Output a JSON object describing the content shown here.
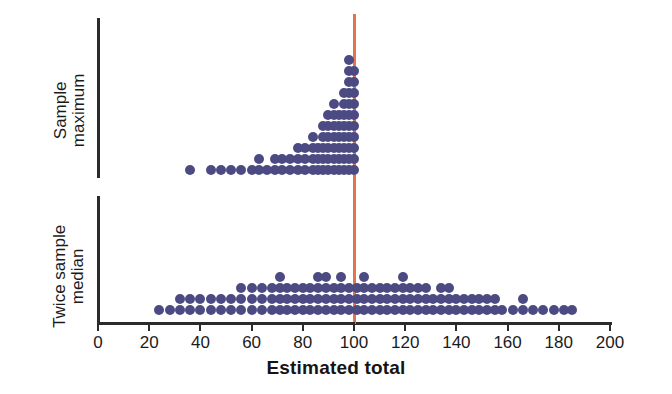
{
  "chart_data": {
    "type": "scatter",
    "plot_style": "dotplot",
    "title": "",
    "xlabel": "Estimated total",
    "ylabel": "",
    "xlim": [
      0,
      200
    ],
    "grid": false,
    "legend": "none",
    "xticks": [
      0,
      20,
      40,
      60,
      80,
      100,
      120,
      140,
      160,
      180,
      200
    ],
    "xtick_labels": [
      "0",
      "20",
      "40",
      "60",
      "80",
      "100",
      "120",
      "140",
      "160",
      "180",
      "200"
    ],
    "annotations": [
      {
        "name": "true-total-reference-line",
        "type": "vline",
        "x": 100,
        "color": "#e8724a"
      }
    ],
    "dot_color": "#4c4a82",
    "axis_color": "#2b2b2b",
    "panels": [
      {
        "name": "sample-maximum",
        "label_line1": "Sample",
        "label_line2": "maximum",
        "direction": "up",
        "baseline_y": 170,
        "dot_spacing": 11.0,
        "stacks": [
          {
            "x": 36,
            "count": 1
          },
          {
            "x": 44,
            "count": 1
          },
          {
            "x": 48,
            "count": 1
          },
          {
            "x": 52,
            "count": 1
          },
          {
            "x": 56,
            "count": 1
          },
          {
            "x": 60,
            "count": 1
          },
          {
            "x": 63,
            "count": 2
          },
          {
            "x": 66,
            "count": 1
          },
          {
            "x": 69,
            "count": 2
          },
          {
            "x": 72,
            "count": 2
          },
          {
            "x": 75,
            "count": 2
          },
          {
            "x": 78,
            "count": 3
          },
          {
            "x": 81,
            "count": 3
          },
          {
            "x": 84,
            "count": 4
          },
          {
            "x": 86,
            "count": 3
          },
          {
            "x": 88,
            "count": 5
          },
          {
            "x": 90,
            "count": 6
          },
          {
            "x": 92,
            "count": 7
          },
          {
            "x": 94,
            "count": 6
          },
          {
            "x": 96,
            "count": 8
          },
          {
            "x": 98,
            "count": 11
          },
          {
            "x": 100,
            "count": 10
          }
        ]
      },
      {
        "name": "twice-sample-median",
        "label_line1": "Twice sample",
        "label_line2": "median",
        "direction": "up",
        "baseline_y": 310,
        "dot_spacing": 11.0,
        "stacks": [
          {
            "x": 24,
            "count": 1
          },
          {
            "x": 28,
            "count": 1
          },
          {
            "x": 32,
            "count": 2
          },
          {
            "x": 36,
            "count": 2
          },
          {
            "x": 40,
            "count": 2
          },
          {
            "x": 44,
            "count": 2
          },
          {
            "x": 48,
            "count": 2
          },
          {
            "x": 52,
            "count": 2
          },
          {
            "x": 56,
            "count": 3
          },
          {
            "x": 60,
            "count": 3
          },
          {
            "x": 64,
            "count": 3
          },
          {
            "x": 68,
            "count": 3
          },
          {
            "x": 71,
            "count": 4
          },
          {
            "x": 74,
            "count": 3
          },
          {
            "x": 77,
            "count": 3
          },
          {
            "x": 80,
            "count": 3
          },
          {
            "x": 83,
            "count": 3
          },
          {
            "x": 86,
            "count": 4
          },
          {
            "x": 89,
            "count": 4
          },
          {
            "x": 92,
            "count": 3
          },
          {
            "x": 95,
            "count": 4
          },
          {
            "x": 98,
            "count": 3
          },
          {
            "x": 101,
            "count": 3
          },
          {
            "x": 104,
            "count": 4
          },
          {
            "x": 107,
            "count": 3
          },
          {
            "x": 110,
            "count": 3
          },
          {
            "x": 113,
            "count": 3
          },
          {
            "x": 116,
            "count": 3
          },
          {
            "x": 119,
            "count": 4
          },
          {
            "x": 122,
            "count": 3
          },
          {
            "x": 125,
            "count": 3
          },
          {
            "x": 128,
            "count": 3
          },
          {
            "x": 131,
            "count": 2
          },
          {
            "x": 134,
            "count": 3
          },
          {
            "x": 137,
            "count": 3
          },
          {
            "x": 140,
            "count": 2
          },
          {
            "x": 143,
            "count": 2
          },
          {
            "x": 146,
            "count": 2
          },
          {
            "x": 149,
            "count": 2
          },
          {
            "x": 152,
            "count": 2
          },
          {
            "x": 155,
            "count": 2
          },
          {
            "x": 158,
            "count": 1
          },
          {
            "x": 162,
            "count": 1
          },
          {
            "x": 166,
            "count": 2
          },
          {
            "x": 170,
            "count": 1
          },
          {
            "x": 174,
            "count": 1
          },
          {
            "x": 178,
            "count": 1
          },
          {
            "x": 182,
            "count": 1
          },
          {
            "x": 185,
            "count": 1
          }
        ]
      }
    ]
  },
  "axis": {
    "x_title": "Estimated total"
  }
}
